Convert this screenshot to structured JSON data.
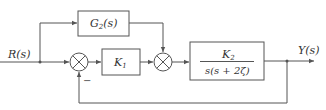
{
  "diagram": {
    "type": "control-system-block-diagram",
    "input": {
      "label": "R(s)"
    },
    "output": {
      "label": "Y(s)"
    },
    "blocks": [
      {
        "id": "G2",
        "label_main": "G",
        "label_sub": "2",
        "label_rest": "(s)"
      },
      {
        "id": "K1",
        "label_main": "K",
        "label_sub": "1"
      },
      {
        "id": "plant",
        "numerator_main": "K",
        "numerator_sub": "2",
        "denominator": "s(s + 2ζ)"
      }
    ],
    "summing_junctions": [
      {
        "id": "sum1",
        "feedback_sign": "−"
      },
      {
        "id": "sum2"
      }
    ],
    "colors": {
      "line": "#555555",
      "text": "#333333",
      "background": "#ffffff"
    }
  }
}
